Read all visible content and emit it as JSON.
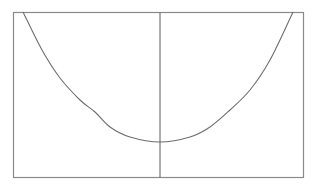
{
  "chart_data": {
    "type": "line",
    "title": "",
    "xlabel": "",
    "ylabel": "",
    "grid": false,
    "legend": null,
    "frame": {
      "left": 13,
      "top": 12,
      "right": 303,
      "bottom": 177
    },
    "vertical_axis_x": 160,
    "series": [
      {
        "name": "curve",
        "pixel_points": [
          [
            23,
            12
          ],
          [
            42,
            50
          ],
          [
            60,
            78
          ],
          [
            80,
            100
          ],
          [
            95,
            112
          ],
          [
            110,
            127
          ],
          [
            130,
            137
          ],
          [
            160,
            142
          ],
          [
            190,
            137
          ],
          [
            210,
            127
          ],
          [
            230,
            110
          ],
          [
            250,
            90
          ],
          [
            270,
            60
          ],
          [
            293,
            12
          ]
        ]
      }
    ],
    "colors": {
      "frame": "#8a8a8a",
      "curve": "#6e6e6e",
      "axis": "#5a5a5a",
      "background": "#ffffff"
    }
  }
}
